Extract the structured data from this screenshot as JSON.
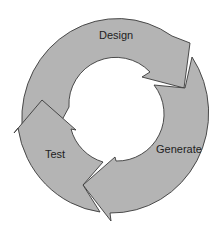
{
  "diagram": {
    "type": "cycle",
    "direction": "clockwise",
    "steps": [
      {
        "label": "Design"
      },
      {
        "label": "Generate"
      },
      {
        "label": "Test"
      }
    ],
    "colors": {
      "fill": "#b4b4b4",
      "stroke": "#3a3a3a",
      "text": "#222222",
      "background": "#ffffff"
    }
  }
}
